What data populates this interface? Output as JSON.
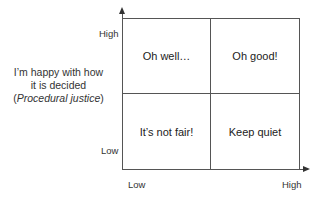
{
  "diagram": {
    "y_axis": {
      "label_line1": "I’m happy with how",
      "label_line2": "it is decided",
      "label_line3": "Procedural justice",
      "high": "High",
      "low": "Low"
    },
    "x_axis": {
      "low": "Low",
      "high": "High"
    },
    "quadrants": {
      "top_left": "Oh well…",
      "top_right": "Oh good!",
      "bottom_left": "It’s not fair!",
      "bottom_right": "Keep quiet"
    },
    "colors": {
      "line": "#555555",
      "text": "#222222",
      "background": "#ffffff"
    }
  }
}
